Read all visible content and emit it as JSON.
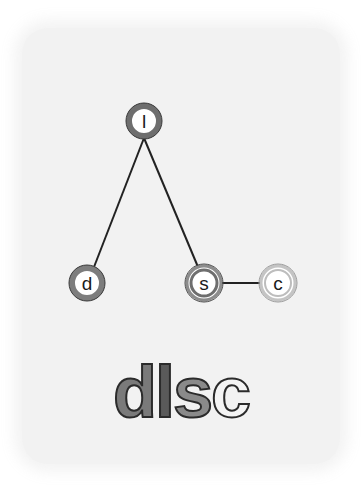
{
  "diagram": {
    "nodes": [
      {
        "id": "l",
        "label": "l",
        "cx": 144,
        "cy": 121,
        "ring": "#6a6a6a",
        "style": "dark"
      },
      {
        "id": "d",
        "label": "d",
        "cx": 87,
        "cy": 283,
        "ring": "#7a7a7a",
        "style": "medium"
      },
      {
        "id": "s",
        "label": "s",
        "cx": 204,
        "cy": 283,
        "ring": "#8a8a8a",
        "style": "double-medium"
      },
      {
        "id": "c",
        "label": "c",
        "cx": 278,
        "cy": 283,
        "ring": "#c8c8c8",
        "style": "double-light"
      }
    ],
    "edges": [
      {
        "from": "l",
        "to": "d"
      },
      {
        "from": "l",
        "to": "s"
      },
      {
        "from": "s",
        "to": "c"
      }
    ]
  },
  "word": {
    "letters": [
      {
        "char": "d",
        "fill": "#7a7a7a"
      },
      {
        "char": "l",
        "fill": "#5a5a5a"
      },
      {
        "char": "s",
        "fill": "#8a8a8a"
      },
      {
        "char": "c",
        "fill": "#f4f4f4"
      }
    ]
  }
}
